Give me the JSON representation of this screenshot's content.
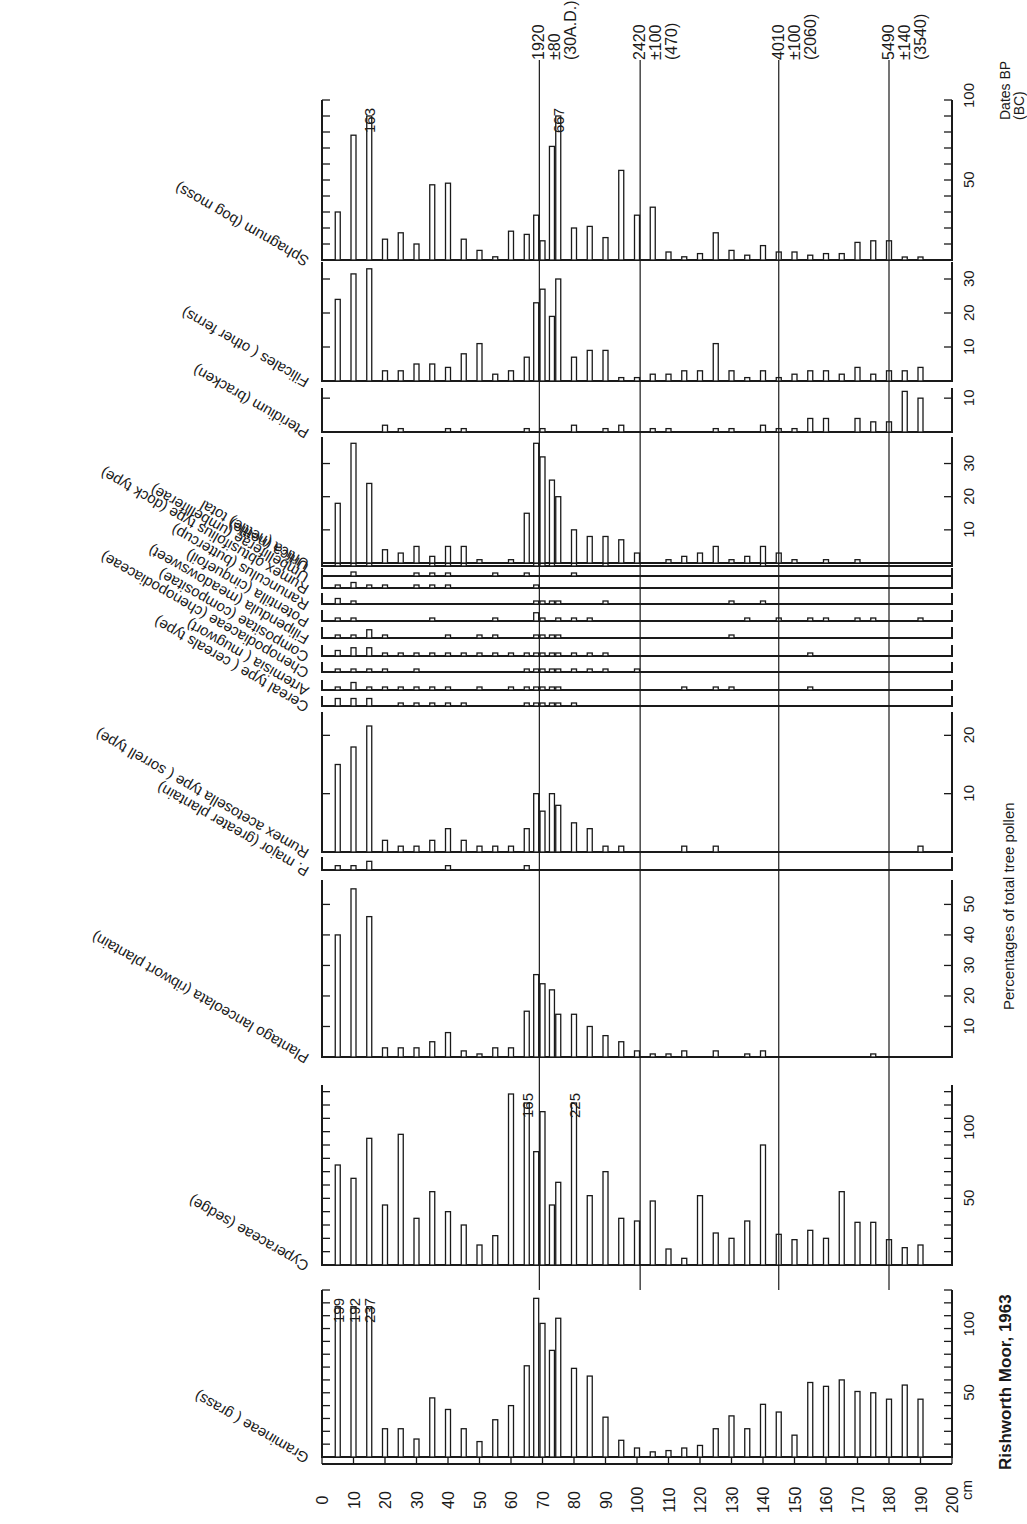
{
  "title": "Rishworth Moor, 1963",
  "chart_data": {
    "type": "bar",
    "title": "Rishworth Moor, 1963",
    "orientation": "depth axis horizontal (bottom), taxa panels stacked vertically, page rotated",
    "xlabel": "cm",
    "ylabel": "Percentages of total tree pollen",
    "depth_axis": {
      "unit": "cm",
      "range": [
        0,
        200
      ],
      "ticks": [
        0,
        10,
        20,
        30,
        40,
        50,
        60,
        70,
        80,
        90,
        100,
        110,
        120,
        130,
        140,
        150,
        160,
        170,
        180,
        190,
        200
      ]
    },
    "dates": {
      "header": "Dates BP",
      "subheader": "(BC)",
      "lines": [
        {
          "depth": 69,
          "bp": "1920",
          "err": "±80",
          "cal": "(30A.D.)"
        },
        {
          "depth": 101,
          "bp": "2420",
          "err": "±100",
          "cal": "(470)"
        },
        {
          "depth": 145,
          "bp": "4010",
          "err": "±100",
          "cal": "(2060)"
        },
        {
          "depth": 180,
          "bp": "5490",
          "err": "±140",
          "cal": "(3540)"
        }
      ]
    },
    "depths": [
      5,
      10,
      15,
      20,
      25,
      30,
      35,
      40,
      45,
      50,
      55,
      60,
      65,
      68,
      70,
      73,
      75,
      80,
      85,
      90,
      95,
      100,
      105,
      110,
      115,
      120,
      125,
      130,
      135,
      140,
      145,
      150,
      155,
      160,
      165,
      170,
      175,
      180,
      185,
      190
    ],
    "series": [
      {
        "name": "Gramineae ( grass)",
        "scale_max": 130,
        "ticks": [
          50,
          100
        ],
        "tick_every": 10,
        "values": [
          199,
          192,
          237,
          22,
          22,
          14,
          46,
          37,
          22,
          12,
          29,
          40,
          71,
          125,
          104,
          83,
          108,
          69,
          63,
          31,
          13,
          7,
          4,
          5,
          7,
          9,
          22,
          32,
          22,
          41,
          35,
          17,
          58,
          55,
          60,
          51,
          50,
          45,
          56,
          45
        ],
        "overflow_labels": [
          {
            "depth": 5,
            "label": "199"
          },
          {
            "depth": 10,
            "label": "192"
          },
          {
            "depth": 15,
            "label": "237"
          }
        ]
      },
      {
        "name": "Cyperaceae (sedge)",
        "scale_max": 135,
        "ticks": [
          50,
          100
        ],
        "tick_every": 10,
        "values": [
          75,
          65,
          95,
          45,
          98,
          35,
          55,
          40,
          30,
          15,
          22,
          132,
          165,
          85,
          115,
          45,
          62,
          225,
          52,
          70,
          35,
          33,
          48,
          12,
          5,
          52,
          24,
          20,
          33,
          90,
          23,
          19,
          26,
          20,
          55,
          32,
          32,
          19,
          13,
          15
        ],
        "overflow_labels": [
          {
            "depth": 65,
            "label": "165"
          },
          {
            "depth": 80,
            "label": "225"
          }
        ]
      },
      {
        "name": "Plantago lanceolata (ribwort plantain)",
        "scale_max": 58,
        "ticks": [
          10,
          20,
          30,
          40,
          50
        ],
        "tick_every": 10,
        "values": [
          40,
          57,
          46,
          3,
          3,
          3,
          5,
          8,
          2,
          1,
          3,
          3,
          15,
          27,
          24,
          22,
          14,
          14,
          10,
          7,
          5,
          2,
          1,
          1,
          2,
          0,
          2,
          0,
          1,
          2,
          0,
          0,
          0,
          0,
          0,
          0,
          1,
          0,
          0,
          0
        ]
      },
      {
        "name": "P. major (greater plantain)",
        "scale_max": 3,
        "ticks": [],
        "tick_every": 0,
        "values": [
          1,
          1,
          2,
          0,
          0,
          0,
          0,
          1,
          0,
          0,
          0,
          0,
          1,
          0,
          0,
          0,
          0,
          0,
          0,
          0,
          0,
          0,
          0,
          0,
          0,
          0,
          0,
          0,
          0,
          0,
          0,
          0,
          0,
          0,
          0,
          0,
          0,
          0,
          0,
          0
        ]
      },
      {
        "name": "Rumex acetosella type ( sorrell type)",
        "scale_max": 24,
        "ticks": [
          10,
          20
        ],
        "tick_every": 10,
        "values": [
          15,
          18,
          26,
          2,
          1,
          1,
          2,
          4,
          2,
          1,
          1,
          1,
          4,
          10,
          7,
          10,
          8,
          5,
          4,
          1,
          1,
          0,
          0,
          0,
          1,
          0,
          1,
          0,
          0,
          0,
          0,
          0,
          0,
          0,
          0,
          0,
          0,
          0,
          0,
          1
        ]
      },
      {
        "name": "Cereal type ( cereals type)",
        "scale_max": 4,
        "ticks": [],
        "tick_every": 0,
        "values": [
          3,
          3,
          3,
          0,
          1,
          1,
          1,
          1,
          1,
          0,
          0,
          0,
          1,
          1,
          1,
          1,
          1,
          1,
          0,
          0,
          0,
          0,
          0,
          0,
          0,
          0,
          0,
          0,
          0,
          0,
          0,
          0,
          0,
          0,
          0,
          0,
          0,
          0,
          0,
          0
        ]
      },
      {
        "name": "Artemisia ( mugwort)",
        "scale_max": 4,
        "ticks": [],
        "tick_every": 0,
        "values": [
          1,
          3,
          1,
          1,
          1,
          1,
          1,
          1,
          0,
          1,
          0,
          1,
          1,
          1,
          1,
          1,
          1,
          0,
          0,
          0,
          0,
          0,
          0,
          0,
          1,
          0,
          1,
          1,
          0,
          0,
          0,
          0,
          1,
          0,
          0,
          0,
          0,
          0,
          0,
          0
        ]
      },
      {
        "name": "Chenopodiaceae (chenopodiaceae)",
        "scale_max": 4,
        "ticks": [],
        "tick_every": 0,
        "values": [
          1,
          1,
          1,
          1,
          0,
          1,
          0,
          0,
          0,
          0,
          0,
          0,
          1,
          1,
          1,
          1,
          1,
          1,
          1,
          1,
          0,
          1,
          0,
          0,
          0,
          0,
          0,
          0,
          0,
          0,
          0,
          0,
          0,
          0,
          0,
          0,
          0,
          0,
          0,
          0
        ]
      },
      {
        "name": "Compositae (compositae)",
        "scale_max": 4,
        "ticks": [],
        "tick_every": 0,
        "values": [
          2,
          3,
          3,
          1,
          1,
          1,
          1,
          1,
          1,
          1,
          1,
          1,
          1,
          1,
          1,
          1,
          1,
          1,
          1,
          1,
          0,
          0,
          0,
          0,
          0,
          0,
          0,
          0,
          0,
          0,
          0,
          0,
          1,
          0,
          0,
          0,
          0,
          0,
          0,
          0
        ]
      },
      {
        "name": "Filipendula (meadowsweet)",
        "scale_max": 4,
        "ticks": [],
        "tick_every": 0,
        "values": [
          1,
          1,
          3,
          1,
          0,
          0,
          0,
          1,
          0,
          1,
          1,
          0,
          0,
          1,
          1,
          1,
          1,
          0,
          0,
          0,
          0,
          0,
          0,
          0,
          0,
          0,
          0,
          1,
          0,
          0,
          0,
          0,
          0,
          0,
          0,
          0,
          0,
          0,
          0,
          0
        ]
      },
      {
        "name": "Potentilla (cinquefoil)",
        "scale_max": 4,
        "ticks": [],
        "tick_every": 0,
        "values": [
          1,
          1,
          0,
          0,
          0,
          0,
          1,
          0,
          0,
          0,
          1,
          0,
          0,
          3,
          1,
          0,
          1,
          1,
          1,
          0,
          0,
          0,
          0,
          0,
          0,
          0,
          0,
          0,
          1,
          0,
          1,
          0,
          1,
          1,
          0,
          1,
          1,
          0,
          0,
          1
        ]
      },
      {
        "name": "Ranunculus (buttercup)",
        "scale_max": 4,
        "ticks": [],
        "tick_every": 0,
        "values": [
          2,
          1,
          0,
          0,
          0,
          0,
          0,
          0,
          0,
          0,
          0,
          0,
          0,
          1,
          1,
          1,
          1,
          0,
          0,
          1,
          0,
          0,
          0,
          0,
          0,
          0,
          0,
          1,
          0,
          1,
          0,
          0,
          0,
          0,
          0,
          0,
          0,
          0,
          0,
          0
        ]
      },
      {
        "name": "Rumex obtusifolius type (dock type)",
        "scale_max": 4,
        "ticks": [],
        "tick_every": 0,
        "values": [
          1,
          2,
          1,
          1,
          0,
          1,
          1,
          1,
          0,
          0,
          0,
          0,
          0,
          1,
          0,
          0,
          0,
          0,
          0,
          0,
          0,
          0,
          0,
          0,
          0,
          0,
          0,
          0,
          0,
          0,
          0,
          0,
          0,
          0,
          0,
          0,
          0,
          0,
          0,
          0
        ]
      },
      {
        "name": "Umbelliferae (umbelliferae)",
        "scale_max": 4,
        "ticks": [],
        "tick_every": 0,
        "values": [
          0,
          2,
          0,
          0,
          0,
          1,
          1,
          1,
          0,
          0,
          1,
          0,
          1,
          0,
          0,
          0,
          0,
          1,
          0,
          0,
          0,
          0,
          0,
          0,
          0,
          0,
          0,
          0,
          0,
          0,
          0,
          0,
          0,
          0,
          0,
          0,
          0,
          0,
          0,
          0
        ]
      },
      {
        "name": "Urtica (nettle)",
        "scale_max": 4,
        "ticks": [],
        "tick_every": 0,
        "values": [
          1,
          2,
          2,
          0,
          0,
          0,
          1,
          1,
          1,
          0,
          0,
          0,
          0,
          1,
          1,
          1,
          0,
          1,
          0,
          1,
          0,
          0,
          0,
          0,
          0,
          0,
          0,
          0,
          0,
          1,
          0,
          0,
          0,
          0,
          0,
          0,
          0,
          0,
          0,
          0
        ]
      },
      {
        "name": "Urtica (nettle) total",
        "scale_max": 38,
        "ticks": [
          10,
          20,
          30
        ],
        "tick_every": 10,
        "values": [
          18,
          38,
          24,
          4,
          3,
          5,
          2,
          5,
          5,
          1,
          0,
          1,
          15,
          37,
          32,
          25,
          20,
          10,
          8,
          8,
          7,
          3,
          0,
          1,
          2,
          3,
          5,
          1,
          2,
          5,
          3,
          1,
          0,
          1,
          0,
          1,
          0,
          0,
          0,
          0
        ]
      },
      {
        "name": "Pteridium (bracken)",
        "scale_max": 13,
        "ticks": [
          10
        ],
        "tick_every": 10,
        "values": [
          0,
          0,
          0,
          2,
          1,
          0,
          0,
          1,
          1,
          0,
          0,
          0,
          1,
          0,
          1,
          0,
          0,
          2,
          0,
          1,
          2,
          0,
          1,
          1,
          0,
          0,
          1,
          1,
          0,
          2,
          1,
          1,
          4,
          4,
          0,
          4,
          3,
          3,
          12,
          10
        ]
      },
      {
        "name": "Filicales ( other ferns)",
        "scale_max": 35,
        "ticks": [
          10,
          20,
          30
        ],
        "tick_every": 10,
        "values": [
          24,
          36,
          33,
          3,
          3,
          5,
          5,
          4,
          8,
          11,
          2,
          3,
          7,
          23,
          27,
          19,
          30,
          7,
          9,
          9,
          1,
          1,
          2,
          2,
          3,
          3,
          11,
          3,
          1,
          3,
          1,
          2,
          3,
          3,
          2,
          4,
          2,
          3,
          3,
          4
        ]
      },
      {
        "name": "Sphagnum (bog moss)",
        "scale_max": 100,
        "ticks": [
          50,
          100
        ],
        "tick_every": 10,
        "values": [
          30,
          78,
          163,
          13,
          17,
          10,
          47,
          48,
          13,
          6,
          2,
          18,
          16,
          28,
          12,
          71,
          667,
          20,
          21,
          14,
          56,
          28,
          33,
          5,
          2,
          4,
          17,
          6,
          3,
          9,
          5,
          5,
          3,
          4,
          4,
          11,
          12,
          12,
          1,
          1
        ],
        "overflow_labels": [
          {
            "depth": 15,
            "label": "163"
          },
          {
            "depth": 75,
            "label": "667"
          }
        ]
      }
    ]
  }
}
